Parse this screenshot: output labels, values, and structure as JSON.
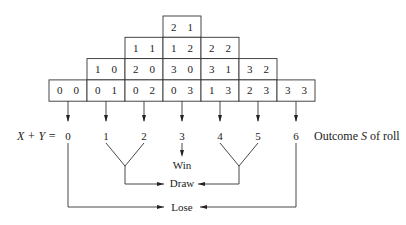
{
  "grid": {
    "rows": [
      {
        "cells": [
          {
            "col": 3,
            "label": "2  1"
          }
        ]
      },
      {
        "cells": [
          {
            "col": 2,
            "label": "1  1"
          },
          {
            "col": 3,
            "label": "1  2"
          },
          {
            "col": 4,
            "label": "2  2"
          }
        ]
      },
      {
        "cells": [
          {
            "col": 1,
            "label": "1  0"
          },
          {
            "col": 2,
            "label": "2  0"
          },
          {
            "col": 3,
            "label": "3  0"
          },
          {
            "col": 4,
            "label": "3  1"
          },
          {
            "col": 5,
            "label": "3  2"
          }
        ]
      },
      {
        "cells": [
          {
            "col": 0,
            "label": "0  0"
          },
          {
            "col": 1,
            "label": "0  1"
          },
          {
            "col": 2,
            "label": "0  2"
          },
          {
            "col": 3,
            "label": "0  3"
          },
          {
            "col": 4,
            "label": "1  3"
          },
          {
            "col": 5,
            "label": "2  3"
          },
          {
            "col": 6,
            "label": "3  3"
          }
        ]
      }
    ]
  },
  "sum_label_prefix": "X + Y =",
  "sums": [
    "0",
    "1",
    "2",
    "3",
    "4",
    "5",
    "6"
  ],
  "outcome_label": "Outcome S of roll",
  "outcomes": {
    "win": "Win",
    "draw": "Draw",
    "lose": "Lose"
  },
  "mapping": {
    "win": [
      "3"
    ],
    "draw": [
      "1",
      "2",
      "4",
      "5"
    ],
    "lose": [
      "0",
      "6"
    ]
  }
}
